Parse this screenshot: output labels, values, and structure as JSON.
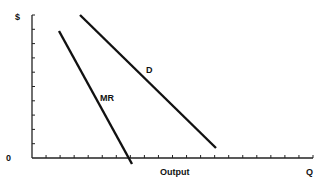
{
  "chart_data": {
    "type": "line",
    "title": "",
    "xlabel": "Output",
    "ylabel": "$",
    "x_end_label": "Q",
    "origin_label": "0",
    "grid": false,
    "legend": "none (curves labeled inline)",
    "x_ticks": 20,
    "y_ticks": 10,
    "series": [
      {
        "name": "D",
        "label": "D",
        "description": "Demand curve, downward sloping",
        "points": [
          [
            80,
            15
          ],
          [
            216,
            148
          ]
        ]
      },
      {
        "name": "MR",
        "label": "MR",
        "description": "Marginal revenue curve, steeper downward slope, crosses output axis",
        "points": [
          [
            59,
            31
          ],
          [
            132,
            164
          ]
        ]
      }
    ],
    "annotations": [
      "D",
      "MR"
    ]
  },
  "axis": {
    "y_label": "$",
    "origin": "0",
    "x_label": "Output",
    "x_end": "Q"
  },
  "curves": {
    "d_label": "D",
    "mr_label": "MR"
  },
  "colors": {
    "line": "#111111",
    "background": "#ffffff"
  }
}
